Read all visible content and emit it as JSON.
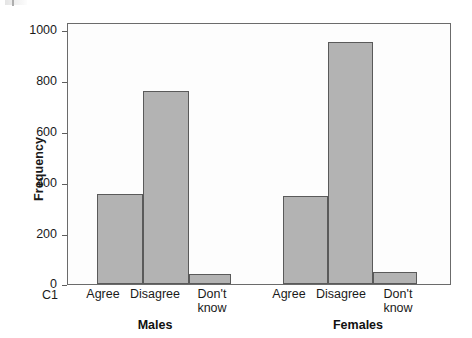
{
  "chart_data": {
    "type": "bar",
    "title": "",
    "subtitle": "",
    "xlabel": "",
    "ylabel": "Frequency",
    "ylim": [
      0,
      1080
    ],
    "yticks": [
      0,
      200,
      400,
      600,
      800,
      1000
    ],
    "grid": false,
    "legend": null,
    "axis_variable_label": "C1",
    "categories": [
      "Agree",
      "Disagree",
      "Don't\nknow"
    ],
    "groups": [
      "Males",
      "Females"
    ],
    "series": [
      {
        "name": "Males",
        "values": [
          374,
          803,
          43
        ]
      },
      {
        "name": "Females",
        "values": [
          366,
          1004,
          51
        ]
      }
    ],
    "bar_fill_color": "#b3b3b3",
    "bar_edge_color": "#5a5a5a",
    "frame_color": "#6b6b6b"
  },
  "axis": {
    "y_tick_labels": [
      "1000",
      "800",
      "600",
      "400",
      "200",
      "0"
    ],
    "y_title": "Frequency",
    "variable_name": "C1"
  },
  "males": {
    "group_label": "Males",
    "cat0_label": "Agree",
    "cat1_label": "Disagree",
    "cat2_label": "Don't\nknow"
  },
  "females": {
    "group_label": "Females",
    "cat0_label": "Agree",
    "cat1_label": "Disagree",
    "cat2_label": "Don't\nknow"
  }
}
